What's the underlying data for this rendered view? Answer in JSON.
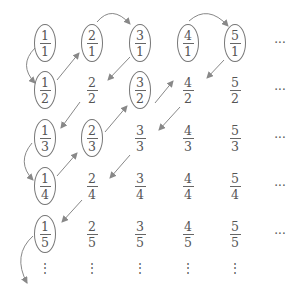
{
  "diagram": {
    "title": "",
    "colors": {
      "line": "#888888",
      "text": "#555555",
      "ellipse": "#777777"
    },
    "columns_x": [
      45,
      92,
      140,
      188,
      235
    ],
    "rows_y": [
      43,
      90,
      138,
      186,
      234
    ],
    "ellipsis_col_x": 280,
    "ellipsis_row_y": 268,
    "cells": [
      {
        "num": "1",
        "den": "1",
        "circled": true,
        "r": 0,
        "c": 0
      },
      {
        "num": "2",
        "den": "1",
        "circled": true,
        "r": 0,
        "c": 1
      },
      {
        "num": "3",
        "den": "1",
        "circled": true,
        "r": 0,
        "c": 2
      },
      {
        "num": "4",
        "den": "1",
        "circled": true,
        "r": 0,
        "c": 3
      },
      {
        "num": "5",
        "den": "1",
        "circled": true,
        "r": 0,
        "c": 4
      },
      {
        "num": "1",
        "den": "2",
        "circled": true,
        "r": 1,
        "c": 0
      },
      {
        "num": "2",
        "den": "2",
        "circled": false,
        "r": 1,
        "c": 1
      },
      {
        "num": "3",
        "den": "2",
        "circled": true,
        "r": 1,
        "c": 2
      },
      {
        "num": "4",
        "den": "2",
        "circled": false,
        "r": 1,
        "c": 3
      },
      {
        "num": "5",
        "den": "2",
        "circled": false,
        "r": 1,
        "c": 4
      },
      {
        "num": "1",
        "den": "3",
        "circled": true,
        "r": 2,
        "c": 0
      },
      {
        "num": "2",
        "den": "3",
        "circled": true,
        "r": 2,
        "c": 1
      },
      {
        "num": "3",
        "den": "3",
        "circled": false,
        "r": 2,
        "c": 2
      },
      {
        "num": "4",
        "den": "3",
        "circled": false,
        "r": 2,
        "c": 3
      },
      {
        "num": "5",
        "den": "3",
        "circled": false,
        "r": 2,
        "c": 4
      },
      {
        "num": "1",
        "den": "4",
        "circled": true,
        "r": 3,
        "c": 0
      },
      {
        "num": "2",
        "den": "4",
        "circled": false,
        "r": 3,
        "c": 1
      },
      {
        "num": "3",
        "den": "4",
        "circled": false,
        "r": 3,
        "c": 2
      },
      {
        "num": "4",
        "den": "4",
        "circled": false,
        "r": 3,
        "c": 3
      },
      {
        "num": "5",
        "den": "4",
        "circled": false,
        "r": 3,
        "c": 4
      },
      {
        "num": "1",
        "den": "5",
        "circled": true,
        "r": 4,
        "c": 0
      },
      {
        "num": "2",
        "den": "5",
        "circled": false,
        "r": 4,
        "c": 1
      },
      {
        "num": "3",
        "den": "5",
        "circled": false,
        "r": 4,
        "c": 2
      },
      {
        "num": "4",
        "den": "5",
        "circled": false,
        "r": 4,
        "c": 3
      },
      {
        "num": "5",
        "den": "5",
        "circled": false,
        "r": 4,
        "c": 4
      }
    ],
    "row_ellipsis": "···",
    "col_ellipsis": "⋮",
    "arrows": [
      {
        "type": "curve",
        "from": [
          35,
          48
        ],
        "to": [
          35,
          83
        ],
        "ctrl": [
          18,
          65
        ]
      },
      {
        "type": "line",
        "from": [
          57,
          80
        ],
        "to": [
          79,
          53
        ]
      },
      {
        "type": "curve",
        "from": [
          97,
          22
        ],
        "to": [
          130,
          24
        ],
        "ctrl": [
          112,
          4
        ]
      },
      {
        "type": "line",
        "from": [
          130,
          57
        ],
        "to": [
          108,
          80
        ]
      },
      {
        "type": "line",
        "from": [
          80,
          102
        ],
        "to": [
          61,
          128
        ]
      },
      {
        "type": "line",
        "from": [
          105,
          132
        ],
        "to": [
          127,
          106
        ]
      },
      {
        "type": "line",
        "from": [
          155,
          103
        ],
        "to": [
          173,
          81
        ]
      },
      {
        "type": "curve",
        "from": [
          189,
          21
        ],
        "to": [
          228,
          26
        ],
        "ctrl": [
          208,
          4
        ]
      },
      {
        "type": "line",
        "from": [
          224,
          60
        ],
        "to": [
          207,
          78
        ]
      },
      {
        "type": "line",
        "from": [
          180,
          107
        ],
        "to": [
          159,
          130
        ]
      },
      {
        "type": "line",
        "from": [
          130,
          155
        ],
        "to": [
          110,
          178
        ]
      },
      {
        "type": "curve",
        "from": [
          32,
          143
        ],
        "to": [
          33,
          180
        ],
        "ctrl": [
          16,
          162
        ]
      },
      {
        "type": "line",
        "from": [
          57,
          176
        ],
        "to": [
          77,
          153
        ]
      },
      {
        "type": "line",
        "from": [
          82,
          200
        ],
        "to": [
          62,
          222
        ]
      },
      {
        "type": "curve",
        "from": [
          33,
          236
        ],
        "to": [
          27,
          283
        ],
        "ctrl": [
          12,
          255
        ]
      }
    ]
  }
}
